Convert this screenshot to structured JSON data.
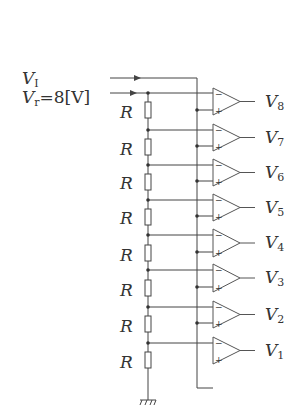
{
  "diagram": {
    "type": "flash-ADC-comparator-ladder",
    "inputs": {
      "vi": {
        "symbol": "V",
        "subscript": "I"
      },
      "vr": {
        "symbol": "V",
        "subscript": "r",
        "value_text": "=8[V]"
      }
    },
    "resistor_label": "R",
    "resistor_count": 8,
    "outputs": [
      {
        "symbol": "V",
        "subscript": "8"
      },
      {
        "symbol": "V",
        "subscript": "7"
      },
      {
        "symbol": "V",
        "subscript": "6"
      },
      {
        "symbol": "V",
        "subscript": "5"
      },
      {
        "symbol": "V",
        "subscript": "4"
      },
      {
        "symbol": "V",
        "subscript": "3"
      },
      {
        "symbol": "V",
        "subscript": "2"
      },
      {
        "symbol": "V",
        "subscript": "1"
      }
    ],
    "opamp_minus_sign": "−",
    "opamp_plus_sign": "+",
    "line_color": "#444444"
  }
}
